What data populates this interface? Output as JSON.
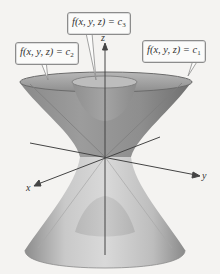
{
  "figure": {
    "labels": [
      {
        "id": "c3",
        "text_main": "f(x, y, z) = c",
        "subscript": "3",
        "surface": "inner paraboloid-like sheet (upper and lower)"
      },
      {
        "id": "c2",
        "text_main": "f(x, y, z) = c",
        "subscript": "2",
        "surface": "double cone"
      },
      {
        "id": "c1",
        "text_main": "f(x, y, z) = c",
        "subscript": "1",
        "surface": "outer hyperboloid of one sheet"
      }
    ],
    "axes": {
      "x": "x",
      "y": "y",
      "z": "z"
    },
    "colors": {
      "background": "#f4f3f1",
      "surface_dark": "#7a7a7a",
      "surface_mid": "#a3a3a3",
      "surface_light": "#d8d8d8",
      "axis": "#444444",
      "label_border": "#8c8c8c"
    }
  }
}
